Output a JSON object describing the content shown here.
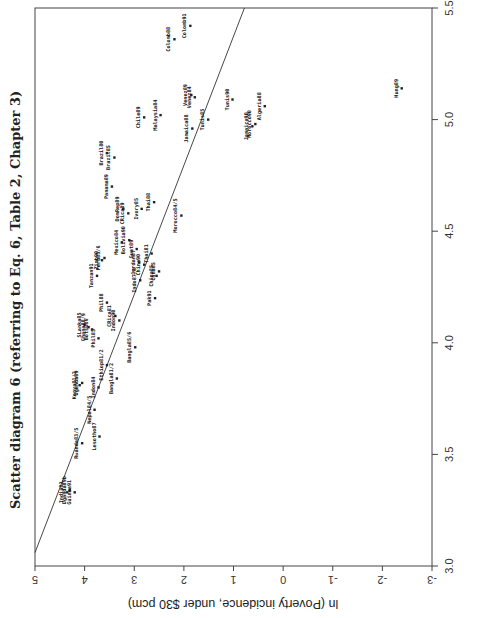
{
  "chart_data": {
    "type": "scatter",
    "orientation": "rotated-90-ccw",
    "title": "Scatter diagram 6 (referring to Eq. 6, Table 2, Chapter 3)",
    "xlabel": "",
    "ylabel": "ln (Poverty incidence, under $30 pcm)",
    "xlim": [
      3.0,
      5.5
    ],
    "ylim": [
      -3,
      5
    ],
    "xticks": [
      "3.0",
      "3.5",
      "4.0",
      "4.5",
      "5.0",
      "5.5"
    ],
    "yticks": [
      "5",
      "4",
      "3",
      "2",
      "1",
      "0",
      "-1",
      "-2",
      "-3"
    ],
    "grid": false,
    "legend": null,
    "regression_line": {
      "from": [
        3.06,
        5.0
      ],
      "to": [
        5.5,
        0.78
      ]
    },
    "points": [
      {
        "label": "Colomb91",
        "x": 5.42,
        "y": 1.87
      },
      {
        "label": "Colomb88",
        "x": 5.36,
        "y": 2.19
      },
      {
        "label": "Hung89",
        "x": 5.14,
        "y": -2.39
      },
      {
        "label": "Venez89",
        "x": 5.11,
        "y": 1.85
      },
      {
        "label": "Venez84",
        "x": 5.1,
        "y": 1.78
      },
      {
        "label": "Tunis90",
        "x": 5.09,
        "y": 1.02
      },
      {
        "label": "Algeria88",
        "x": 5.06,
        "y": 0.37
      },
      {
        "label": "Chile89",
        "x": 5.01,
        "y": 2.8
      },
      {
        "label": "Malaysia84",
        "x": 5.02,
        "y": 2.47
      },
      {
        "label": "Tunis85",
        "x": 5.0,
        "y": 1.51
      },
      {
        "label": "Morocco90",
        "x": 4.98,
        "y": 0.56
      },
      {
        "label": "Jamaica90",
        "x": 4.97,
        "y": 0.62
      },
      {
        "label": "Jamaica88",
        "x": 4.96,
        "y": 1.83
      },
      {
        "label": "Brazil85",
        "x": 4.83,
        "y": 3.4
      },
      {
        "label": "Brazil80",
        "x": 4.85,
        "y": 3.55
      },
      {
        "label": "Panama89",
        "x": 4.7,
        "y": 3.45
      },
      {
        "label": "DomRep89",
        "x": 4.6,
        "y": 3.22
      },
      {
        "label": "CRica89",
        "x": 4.58,
        "y": 3.12
      },
      {
        "label": "Ivory85",
        "x": 4.6,
        "y": 2.85
      },
      {
        "label": "Thai88",
        "x": 4.63,
        "y": 2.6
      },
      {
        "label": "Morocco84/5",
        "x": 4.57,
        "y": 2.05
      },
      {
        "label": "Peru85/6",
        "x": 4.38,
        "y": 3.6
      },
      {
        "label": "Mexico84",
        "x": 4.45,
        "y": 3.25
      },
      {
        "label": "Bolivia90",
        "x": 4.46,
        "y": 3.1
      },
      {
        "label": "Guat89",
        "x": 4.42,
        "y": 2.95
      },
      {
        "label": "Thai81",
        "x": 4.4,
        "y": 2.65
      },
      {
        "label": "Jordan87",
        "x": 4.36,
        "y": 2.9
      },
      {
        "label": "China90",
        "x": 4.35,
        "y": 2.8
      },
      {
        "label": "Tanzan91",
        "x": 4.3,
        "y": 3.75
      },
      {
        "label": "Zimb90",
        "x": 4.37,
        "y": 3.65
      },
      {
        "label": "Indo87/8",
        "x": 4.28,
        "y": 2.88
      },
      {
        "label": "Pak91",
        "x": 4.2,
        "y": 2.58
      },
      {
        "label": "China85",
        "x": 4.3,
        "y": 2.55
      },
      {
        "label": "Chna85",
        "x": 4.32,
        "y": 2.5
      },
      {
        "label": "Phil88",
        "x": 4.18,
        "y": 3.55
      },
      {
        "label": "CRica81",
        "x": 4.12,
        "y": 3.38
      },
      {
        "label": "Phil85",
        "x": 4.02,
        "y": 3.72
      },
      {
        "label": "Indon90",
        "x": 4.1,
        "y": 3.3
      },
      {
        "label": "Bangla85/6",
        "x": 3.98,
        "y": 2.98
      },
      {
        "label": "SLanka85",
        "x": 4.08,
        "y": 4.0
      },
      {
        "label": "Ghana88/9",
        "x": 4.07,
        "y": 3.92
      },
      {
        "label": "Botsw86",
        "x": 4.06,
        "y": 3.85
      },
      {
        "label": "Ethiop81/2",
        "x": 3.9,
        "y": 3.55
      },
      {
        "label": "Bangla81/2",
        "x": 3.84,
        "y": 3.35
      },
      {
        "label": "Indon84",
        "x": 3.8,
        "y": 3.72
      },
      {
        "label": "Kenya81/2",
        "x": 3.81,
        "y": 4.1
      },
      {
        "label": "Uganda89",
        "x": 3.82,
        "y": 4.05
      },
      {
        "label": "Nepal84/5",
        "x": 3.7,
        "y": 3.8
      },
      {
        "label": "Rwanda83/5",
        "x": 3.55,
        "y": 4.05
      },
      {
        "label": "Lesotho87",
        "x": 3.58,
        "y": 3.7
      },
      {
        "label": "Uganda89b",
        "x": 3.34,
        "y": 4.3
      },
      {
        "label": "India83",
        "x": 3.33,
        "y": 4.35
      },
      {
        "label": "Guinea91",
        "x": 3.33,
        "y": 4.2
      }
    ]
  },
  "axes": {
    "x_axis_label_visible": false
  }
}
